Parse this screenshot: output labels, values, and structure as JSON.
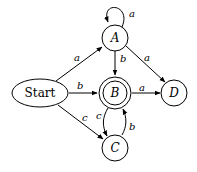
{
  "diagram": {
    "type": "finite-state-automaton",
    "nodes": [
      {
        "id": "start",
        "label": "Start",
        "shape": "ellipse",
        "accepting": false
      },
      {
        "id": "A",
        "label": "A",
        "shape": "circle",
        "accepting": false
      },
      {
        "id": "B",
        "label": "B",
        "shape": "circle",
        "accepting": true
      },
      {
        "id": "C",
        "label": "C",
        "shape": "circle",
        "accepting": false
      },
      {
        "id": "D",
        "label": "D",
        "shape": "circle",
        "accepting": false
      }
    ],
    "edges": [
      {
        "from": "start",
        "to": "A",
        "label": "a"
      },
      {
        "from": "start",
        "to": "B",
        "label": "b"
      },
      {
        "from": "start",
        "to": "C",
        "label": "c"
      },
      {
        "from": "A",
        "to": "A",
        "label": "a"
      },
      {
        "from": "A",
        "to": "B",
        "label": "b"
      },
      {
        "from": "A",
        "to": "D",
        "label": "a"
      },
      {
        "from": "B",
        "to": "D",
        "label": "a"
      },
      {
        "from": "B",
        "to": "C",
        "label": "c"
      },
      {
        "from": "C",
        "to": "B",
        "label": "b"
      }
    ]
  }
}
